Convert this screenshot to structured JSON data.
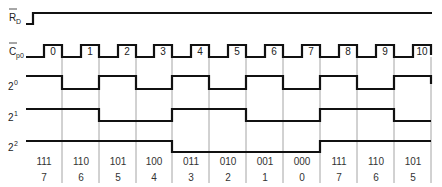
{
  "diagram": {
    "type": "timing-diagram",
    "signals": [
      {
        "id": "rd",
        "label_main": "R",
        "label_sub": "D",
        "overbar": true
      },
      {
        "id": "cp0",
        "label_main": "C",
        "label_sub": "p0",
        "overbar": true
      },
      {
        "id": "b0",
        "label_main": "2",
        "label_sup": "0"
      },
      {
        "id": "b1",
        "label_main": "2",
        "label_sup": "1"
      },
      {
        "id": "b2",
        "label_main": "2",
        "label_sup": "2"
      }
    ],
    "clock_pulses": [
      "0",
      "1",
      "2",
      "3",
      "4",
      "5",
      "6",
      "7",
      "8",
      "9",
      "10"
    ],
    "states": [
      {
        "binary": "111",
        "decimal": "7"
      },
      {
        "binary": "110",
        "decimal": "6"
      },
      {
        "binary": "101",
        "decimal": "5"
      },
      {
        "binary": "100",
        "decimal": "4"
      },
      {
        "binary": "011",
        "decimal": "3"
      },
      {
        "binary": "010",
        "decimal": "2"
      },
      {
        "binary": "001",
        "decimal": "1"
      },
      {
        "binary": "000",
        "decimal": "0"
      },
      {
        "binary": "111",
        "decimal": "7"
      },
      {
        "binary": "110",
        "decimal": "6"
      },
      {
        "binary": "101",
        "decimal": "5"
      }
    ],
    "bit_levels": {
      "b0": [
        1,
        0,
        1,
        0,
        1,
        0,
        1,
        0,
        1,
        0,
        1
      ],
      "b1": [
        1,
        1,
        0,
        0,
        1,
        1,
        0,
        0,
        1,
        1,
        0
      ],
      "b2": [
        1,
        1,
        1,
        1,
        0,
        0,
        0,
        0,
        1,
        1,
        1
      ]
    },
    "colors": {
      "trace": "#111111",
      "grid": "#9a9a9a",
      "text": "#222222"
    }
  }
}
